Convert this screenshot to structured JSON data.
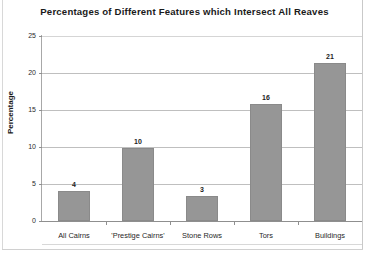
{
  "chart_data": {
    "type": "bar",
    "title": "Percentages of Different Features which Intersect All Reaves",
    "xlabel": "",
    "ylabel": "Percentage",
    "categories": [
      "All Cairns",
      "'Prestige Cairns'",
      "Stone Rows",
      "Tors",
      "Buildings"
    ],
    "values": [
      4.1,
      9.8,
      3.4,
      15.8,
      21.3
    ],
    "data_labels": [
      "4",
      "10",
      "3",
      "16",
      "21"
    ],
    "ylim": [
      0,
      25
    ],
    "yticks": [
      0,
      5,
      10,
      15,
      20,
      25
    ],
    "ytick_labels": [
      "0",
      "5",
      "10",
      "15",
      "20",
      "25"
    ],
    "grid": true,
    "legend": false,
    "bar_color": "#969696",
    "bar_edge_color": "#8a8a8a",
    "gridline_color": "#bfbfbf",
    "axis_color": "#8f8f8f",
    "background_color": "#ffffff",
    "text_color": "#1a1a1a"
  },
  "figure": {
    "caption_partial": ""
  }
}
